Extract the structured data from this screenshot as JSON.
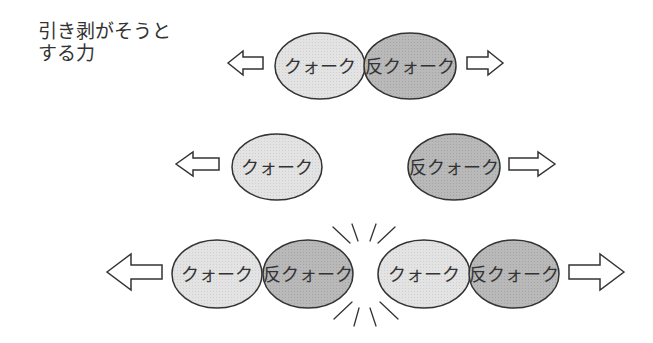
{
  "caption": {
    "line1": "引き剥がそうと",
    "line2": "する力"
  },
  "labels": {
    "quark": "クォーク",
    "antiquark": "反クォーク"
  },
  "colors": {
    "quark_fill": "#e3e3e3",
    "antiquark_fill": "#b9b9b9",
    "outline": "#333333",
    "arrow_fill": "#ffffff"
  },
  "rows": [
    {
      "name": "top",
      "left_arrow": true,
      "right_arrow": true,
      "particles": [
        "quark",
        "antiquark"
      ]
    },
    {
      "name": "middle",
      "left_arrow": true,
      "right_arrow": true,
      "particles": [
        "quark",
        "antiquark"
      ],
      "separated": true
    },
    {
      "name": "bottom",
      "left_arrow": true,
      "right_arrow": true,
      "particles": [
        "quark",
        "antiquark",
        "quark",
        "antiquark"
      ],
      "spark": true
    }
  ]
}
